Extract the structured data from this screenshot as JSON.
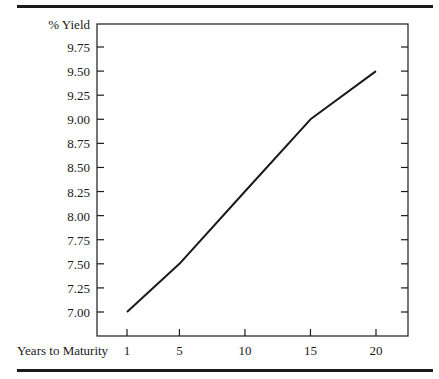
{
  "chart_data": {
    "type": "line",
    "title": "",
    "xlabel": "Years to Maturity",
    "ylabel": "% Yield",
    "x": [
      1,
      5,
      10,
      15,
      20
    ],
    "categories": [
      "1",
      "5",
      "10",
      "15",
      "20"
    ],
    "series": [
      {
        "name": "Yield curve",
        "values": [
          7.0,
          7.5,
          8.25,
          9.0,
          9.5
        ]
      }
    ],
    "y_ticks": [
      "9.75",
      "9.50",
      "9.25",
      "9.00",
      "8.75",
      "8.50",
      "8.25",
      "8.00",
      "7.75",
      "7.50",
      "7.25",
      "7.00"
    ],
    "x_ticks": [
      "1",
      "5",
      "10",
      "15",
      "20"
    ],
    "ylim": [
      6.75,
      10.0
    ],
    "grid": false,
    "legend": "none"
  },
  "colors": {
    "ink": "#1a1a1a",
    "background": "#ffffff"
  }
}
